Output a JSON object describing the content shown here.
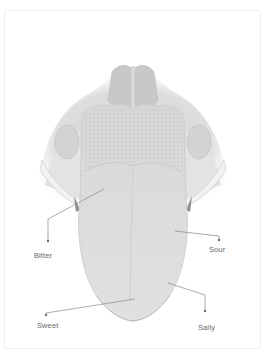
{
  "diagram": {
    "colors": {
      "background": "#ffffff",
      "frame_border": "#efefef",
      "tongue_fill": "#d9d9d9",
      "tongue_light": "#e8e8e8",
      "shadow": "#9a9a9a",
      "leader_line": "#8a8a8a",
      "label_text": "#6a6a6a"
    },
    "labels": [
      {
        "id": "bitter",
        "text": "Bitter",
        "x": 34,
        "y": 251
      },
      {
        "id": "sour",
        "text": "Sour",
        "x": 209,
        "y": 245
      },
      {
        "id": "sweet",
        "text": "Sweet",
        "x": 37,
        "y": 321
      },
      {
        "id": "salty",
        "text": "Salty",
        "x": 198,
        "y": 323
      }
    ]
  }
}
